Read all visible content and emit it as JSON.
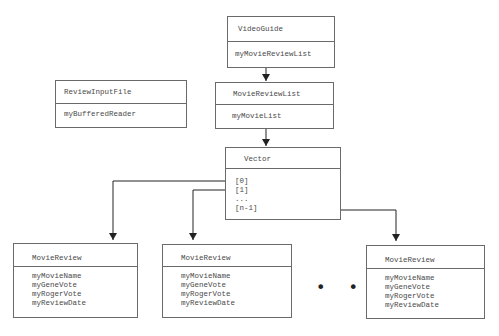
{
  "diagram": {
    "type": "class-relationship",
    "video_guide": {
      "class_name": "VideoGuide",
      "fields": [
        "myMovieReviewList"
      ]
    },
    "review_input_file": {
      "class_name": "ReviewInputFile",
      "fields": [
        "myBufferedReader"
      ]
    },
    "movie_review_list": {
      "class_name": "MovieReviewList",
      "fields": [
        "myMovieList"
      ]
    },
    "vector": {
      "class_name": "Vector",
      "elements": [
        "[0]",
        "[1]",
        "...",
        "[n-1]"
      ]
    },
    "movie_reviews": [
      {
        "class_name": "MovieReview",
        "fields": [
          "myMovieName",
          "myGeneVote",
          "myRogerVote",
          "myReviewDate"
        ]
      },
      {
        "class_name": "MovieReview",
        "fields": [
          "myMovieName",
          "myGeneVote",
          "myRogerVote",
          "myReviewDate"
        ]
      },
      {
        "class_name": "MovieReview",
        "fields": [
          "myMovieName",
          "myGeneVote",
          "myRogerVote",
          "myReviewDate"
        ]
      }
    ],
    "ellipsis": "• • •",
    "edges": [
      {
        "from": "VideoGuide.myMovieReviewList",
        "to": "MovieReviewList"
      },
      {
        "from": "MovieReviewList.myMovieList",
        "to": "Vector"
      },
      {
        "from": "Vector[0]",
        "to": "MovieReview (1)"
      },
      {
        "from": "Vector[1]",
        "to": "MovieReview (2)"
      },
      {
        "from": "Vector[n-1]",
        "to": "MovieReview (n)"
      }
    ],
    "colors": {
      "line": "#222222",
      "border": "#6a6a6a",
      "text": "#4a4a4a"
    }
  }
}
